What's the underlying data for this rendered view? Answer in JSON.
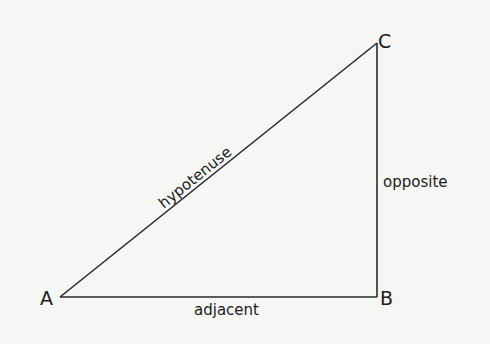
{
  "diagram": {
    "type": "right-triangle",
    "vertices": [
      {
        "name": "A",
        "x": 60,
        "y": 297
      },
      {
        "name": "B",
        "x": 377,
        "y": 297
      },
      {
        "name": "C",
        "x": 377,
        "y": 43
      }
    ],
    "labels": {
      "vertex_a": "A",
      "vertex_b": "B",
      "vertex_c": "C",
      "hypotenuse": "hypotenuse",
      "opposite": "opposite",
      "adjacent": "adjacent"
    },
    "colors": {
      "line": "#2a2a2a",
      "text": "#1c1c1c",
      "background": "#f6f6f5"
    }
  }
}
